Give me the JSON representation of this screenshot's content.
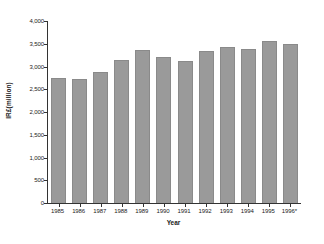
{
  "chart_data": {
    "type": "bar",
    "title": "",
    "subtitle": "",
    "xlabel": "Year",
    "ylabel": "IR£(million)",
    "categories": [
      "1985",
      "1986",
      "1987",
      "1988",
      "1989",
      "1990",
      "1991",
      "1992",
      "1993",
      "1994",
      "1995",
      "1996*"
    ],
    "values": [
      2740,
      2720,
      2870,
      3150,
      3370,
      3205,
      3125,
      3340,
      3420,
      3390,
      3565,
      3485
    ],
    "series": [
      {
        "name": "IR£(million)",
        "values": [
          2740,
          2720,
          2870,
          3150,
          3370,
          3205,
          3125,
          3340,
          3420,
          3390,
          3565,
          3485
        ]
      }
    ],
    "ylim": [
      0,
      4000
    ],
    "ytick_values": [
      0,
      500,
      1000,
      1500,
      2000,
      2500,
      3000,
      3500,
      4000
    ],
    "ytick_labels": [
      "0",
      "500",
      "1,000",
      "1,500",
      "2,000",
      "2,500",
      "3,000",
      "3,500",
      "4,000"
    ],
    "grid": false,
    "legend": false,
    "legend_position": "none",
    "bar_color": "#9a9a9a",
    "axis_color": "#333333",
    "background_color": "#ffffff",
    "annotations": [
      "* figure for 1996 marked with asterisk"
    ]
  }
}
